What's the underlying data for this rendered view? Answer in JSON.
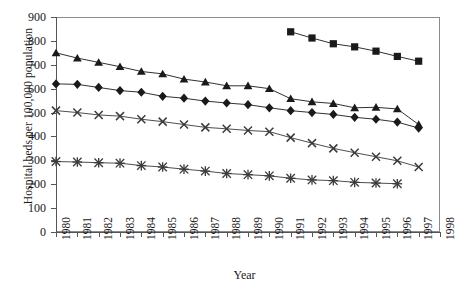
{
  "chart_data": {
    "type": "line",
    "title": "",
    "xlabel": "Year",
    "ylabel": "Hospital beds per 100,000 population",
    "x": [
      1980,
      1981,
      1982,
      1983,
      1984,
      1985,
      1986,
      1987,
      1988,
      1989,
      1990,
      1991,
      1992,
      1993,
      1994,
      1995,
      1996,
      1997
    ],
    "xlim": [
      1980,
      1998
    ],
    "ylim": [
      0,
      900
    ],
    "yticks": [
      0,
      100,
      200,
      300,
      400,
      500,
      600,
      700,
      800,
      900
    ],
    "xticks": [
      "1980",
      "1981",
      "1982",
      "1983",
      "1984",
      "1985",
      "1986",
      "1987",
      "1988",
      "1989",
      "1990",
      "1991",
      "1992",
      "1993",
      "1994",
      "1995",
      "1996",
      "1997",
      "1998"
    ],
    "grid": false,
    "legend": "none",
    "series": [
      {
        "name": "series-square",
        "marker": "square",
        "color": "#1a1a1a",
        "x": [
          1991,
          1992,
          1993,
          1994,
          1995,
          1996,
          1997
        ],
        "values": [
          838,
          812,
          788,
          775,
          757,
          735,
          715
        ]
      },
      {
        "name": "series-triangle",
        "marker": "triangle",
        "color": "#1a1a1a",
        "x": [
          1980,
          1981,
          1982,
          1983,
          1984,
          1985,
          1986,
          1987,
          1988,
          1989,
          1990,
          1991,
          1992,
          1993,
          1994,
          1995,
          1996,
          1997
        ],
        "values": [
          750,
          728,
          710,
          692,
          672,
          662,
          640,
          628,
          612,
          612,
          600,
          558,
          545,
          538,
          520,
          522,
          515,
          450
        ]
      },
      {
        "name": "series-diamond",
        "marker": "diamond",
        "color": "#1a1a1a",
        "x": [
          1980,
          1981,
          1982,
          1983,
          1984,
          1985,
          1986,
          1987,
          1988,
          1989,
          1990,
          1991,
          1992,
          1993,
          1994,
          1995,
          1996,
          1997
        ],
        "values": [
          620,
          618,
          605,
          592,
          585,
          568,
          560,
          548,
          540,
          533,
          520,
          508,
          500,
          492,
          480,
          472,
          460,
          435
        ]
      },
      {
        "name": "series-cross",
        "marker": "cross",
        "color": "#3a3a3a",
        "x": [
          1980,
          1981,
          1982,
          1983,
          1984,
          1985,
          1986,
          1987,
          1988,
          1989,
          1990,
          1991,
          1992,
          1993,
          1994,
          1995,
          1996,
          1997
        ],
        "values": [
          508,
          500,
          490,
          485,
          472,
          462,
          450,
          438,
          432,
          425,
          420,
          395,
          372,
          350,
          332,
          315,
          298,
          272
        ]
      },
      {
        "name": "series-asterisk",
        "marker": "asterisk",
        "color": "#3a3a3a",
        "x": [
          1980,
          1981,
          1982,
          1983,
          1984,
          1985,
          1986,
          1987,
          1988,
          1989,
          1990,
          1991,
          1992,
          1993,
          1994,
          1995,
          1996
        ],
        "values": [
          295,
          293,
          290,
          288,
          278,
          272,
          263,
          255,
          245,
          240,
          235,
          225,
          218,
          215,
          208,
          205,
          202
        ]
      }
    ]
  }
}
